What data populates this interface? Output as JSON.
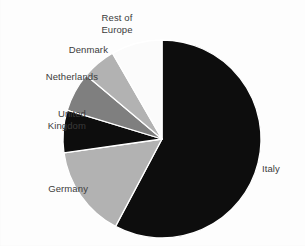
{
  "chart_data": {
    "type": "pie",
    "title": "",
    "subtitle": "",
    "xlabel": "",
    "ylabel": "",
    "legend_position": "callout-labels-outside",
    "grid": false,
    "center": {
      "x": 162,
      "y": 139
    },
    "radius": 99,
    "start_angle_deg": 0,
    "direction": "clockwise",
    "categories": [
      "Italy",
      "Germany",
      "United Kingdom",
      "Netherlands",
      "Denmark",
      "Rest of Europe"
    ],
    "values": [
      58,
      15,
      7,
      6.5,
      5.5,
      8
    ],
    "slices": [
      {
        "label": "Italy",
        "label_line1": "Italy",
        "label_line2": "",
        "value": 58,
        "start_deg": 0,
        "end_deg": 208,
        "color": "#0d0d0d"
      },
      {
        "label": "Germany",
        "label_line1": "Germany",
        "label_line2": "",
        "value": 15,
        "start_deg": 208,
        "end_deg": 262,
        "color": "#b2b2b2"
      },
      {
        "label": "United Kingdom",
        "label_line1": "United",
        "label_line2": "Kingdom",
        "value": 7,
        "start_deg": 262,
        "end_deg": 287,
        "color": "#0d0d0d"
      },
      {
        "label": "Netherlands",
        "label_line1": "Netherlands",
        "label_line2": "",
        "value": 6.5,
        "start_deg": 287,
        "end_deg": 310,
        "color": "#7f7f7f"
      },
      {
        "label": "Denmark",
        "label_line1": "Denmark",
        "label_line2": "",
        "value": 5.5,
        "start_deg": 310,
        "end_deg": 330,
        "color": "#b2b2b2"
      },
      {
        "label": "Rest of Europe",
        "label_line1": "Rest of",
        "label_line2": "Europe",
        "value": 8,
        "start_deg": 330,
        "end_deg": 360,
        "color": "#fbfbfb"
      }
    ]
  },
  "labels": {
    "rest_of_europe_line1": "Rest of",
    "rest_of_europe_line2": "Europe",
    "denmark": "Denmark",
    "netherlands": "Netherlands",
    "united_kingdom_line1": "United",
    "united_kingdom_line2": "Kingdom",
    "germany": "Germany",
    "italy": "Italy"
  },
  "colors": {
    "background": "#fdfdfd",
    "text": "#3b3b3b",
    "slice_black": "#0d0d0d",
    "slice_light_gray": "#b2b2b2",
    "slice_dark_gray": "#7f7f7f",
    "slice_white": "#fbfbfb",
    "slice_outline": "#ffffff"
  }
}
